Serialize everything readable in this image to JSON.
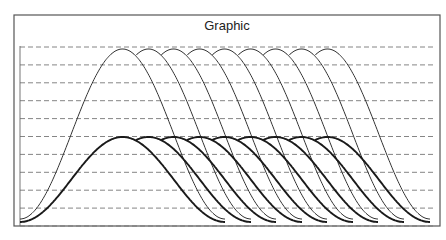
{
  "chart_data": {
    "type": "line",
    "title": "Graphic",
    "xlabel": "",
    "ylabel": "",
    "grid": "horizontal dashed",
    "gridlines_count": 11,
    "legend": null,
    "x_range_px": [
      20,
      428
    ],
    "series": [
      {
        "name": "thin curves",
        "line": "thin",
        "count": 9,
        "peak_relative": 1.0,
        "peaks_x_px": [
          120,
          146,
          171,
          197,
          222,
          248,
          273,
          299,
          325
        ],
        "end_x_px": [
          225,
          251,
          276,
          302,
          327,
          353,
          378,
          404,
          429
        ]
      },
      {
        "name": "thick curves",
        "line": "thick",
        "count": 9,
        "peak_relative": 0.5,
        "peaks_x_px": [
          120,
          146,
          171,
          197,
          222,
          248,
          273,
          299,
          325
        ],
        "end_x_px": [
          225,
          251,
          276,
          302,
          327,
          353,
          378,
          404,
          429
        ]
      }
    ]
  },
  "figure": {
    "title": "Graphic",
    "colors": {
      "line": "#222222",
      "grid": "#777777",
      "frame": "#555555"
    }
  }
}
